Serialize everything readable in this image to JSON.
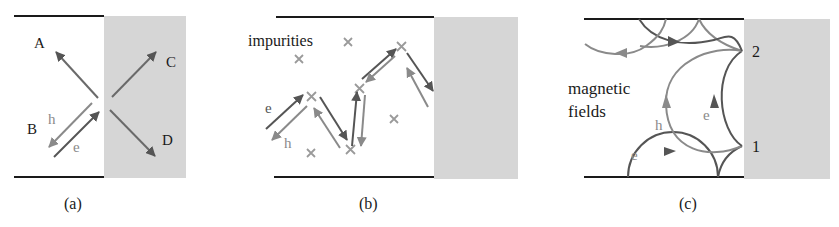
{
  "figure": {
    "panels": [
      {
        "id": "a",
        "caption": "(a)",
        "labels": {
          "A": "A",
          "B": "B",
          "C": "C",
          "D": "D",
          "h": "h",
          "e": "e"
        }
      },
      {
        "id": "b",
        "caption": "(b)",
        "labels": {
          "impurities": "impurities",
          "e": "e",
          "h": "h"
        }
      },
      {
        "id": "c",
        "caption": "(c)",
        "labels": {
          "magnetic": "magnetic",
          "fields": "fields",
          "h": "h",
          "e_right": "e",
          "e_bottom": "e",
          "point1": "1",
          "point2": "2"
        }
      }
    ],
    "colors": {
      "wall": "#1a1a1a",
      "superconductor": "#d6d6d6",
      "electron": "#555555",
      "hole": "#8a8a8a",
      "impurity": "#9a9a9a",
      "text": "#1a1a1a",
      "label_gray": "#8a8a8a"
    }
  }
}
